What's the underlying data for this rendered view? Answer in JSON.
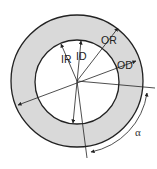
{
  "diagram": {
    "type": "annulus-geometry",
    "colors": {
      "ring_fill": "#d9d9d9",
      "stroke": "#222222",
      "background": "#ffffff"
    },
    "labels": {
      "inner_radius": "IR",
      "inner_diameter": "ID",
      "outer_radius": "OR",
      "outer_diameter": "OD",
      "angle": "α"
    }
  }
}
